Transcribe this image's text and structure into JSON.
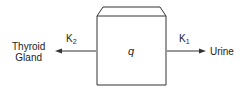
{
  "diagram": {
    "compartment": {
      "label": "q"
    },
    "left_flow": {
      "rate": "K",
      "rate_sub": "2",
      "target_line1": "Thyroid",
      "target_line2": "Gland"
    },
    "right_flow": {
      "rate": "K",
      "rate_sub": "1",
      "target": "Urine"
    },
    "colors": {
      "stroke": "#333333",
      "background": "#ffffff"
    }
  }
}
